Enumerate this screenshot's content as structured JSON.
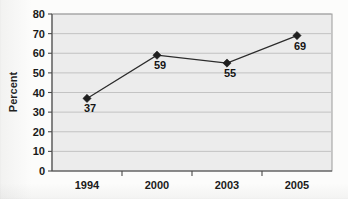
{
  "chart_data": {
    "type": "line",
    "title": "",
    "subtitle": "",
    "xlabel": "",
    "ylabel": "Percent",
    "categories": [
      "1994",
      "2000",
      "2003",
      "2005"
    ],
    "values": [
      37,
      59,
      55,
      69
    ],
    "point_labels": [
      "37",
      "59",
      "55",
      "69"
    ],
    "series": [
      {
        "name": "Percent",
        "values": [
          37,
          59,
          55,
          69
        ]
      }
    ],
    "ylim": [
      0,
      80
    ],
    "ytick_step": 10,
    "yticks": [
      0,
      10,
      20,
      30,
      40,
      50,
      60,
      70,
      80
    ],
    "ytick_labels": [
      "0",
      "10",
      "20",
      "30",
      "40",
      "50",
      "60",
      "70",
      "80"
    ],
    "grid": "horizontal",
    "legend": "none",
    "marker": "diamond",
    "colors": {
      "line": "#2b2b2b",
      "marker": "#1f1f1f",
      "plot_background": "#ececec",
      "gridline": "#b9b9b9",
      "axis": "#4a4a4a",
      "text": "#191919",
      "page_background": "#fcfcfb"
    }
  }
}
